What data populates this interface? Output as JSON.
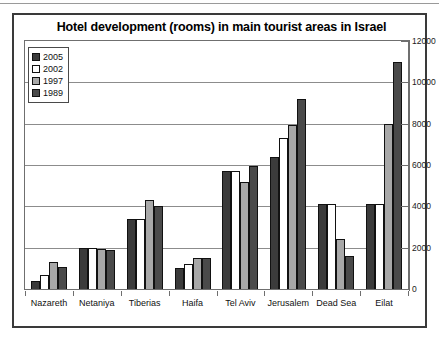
{
  "chart_data": {
    "type": "bar",
    "title": "Hotel development (rooms) in main tourist areas in Israel",
    "xlabel": "",
    "ylabel": "",
    "ylim": [
      0,
      12000
    ],
    "yticks": [
      0,
      2000,
      4000,
      6000,
      8000,
      10000,
      12000
    ],
    "ytick_labels": [
      "0",
      "2000",
      "4000",
      "6000",
      "8000",
      "10000",
      "12000"
    ],
    "grid": true,
    "y_axis_position": "right",
    "legend_position": "top-left-inside",
    "categories": [
      "Nazareth",
      "Netaniya",
      "Tiberias",
      "Haifa",
      "Tel Aviv",
      "Jerusalem",
      "Dead Sea",
      "Eilat"
    ],
    "series": [
      {
        "name": "2005",
        "color": "#3b3b3b",
        "values": [
          400,
          2000,
          3400,
          1000,
          5700,
          6400,
          4100,
          4100
        ]
      },
      {
        "name": "2002",
        "color": "#ffffff",
        "values": [
          700,
          2000,
          3400,
          1200,
          5700,
          7300,
          4100,
          4100
        ]
      },
      {
        "name": "1997",
        "color": "#a8a8a8",
        "values": [
          1300,
          1950,
          4300,
          1500,
          5200,
          7950,
          2400,
          8000
        ]
      },
      {
        "name": "1989",
        "color": "#4a4a4a",
        "values": [
          1050,
          1900,
          4000,
          1500,
          5950,
          9200,
          1600,
          11000
        ]
      }
    ]
  },
  "legend": {
    "items": [
      {
        "label": "2005",
        "swatch": "s2005"
      },
      {
        "label": "2002",
        "swatch": "s2002"
      },
      {
        "label": "1997",
        "swatch": "s1997"
      },
      {
        "label": "1989",
        "swatch": "s1989"
      }
    ]
  }
}
